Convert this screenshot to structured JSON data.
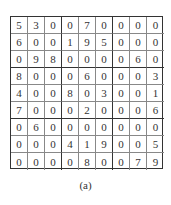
{
  "puzzle": {
    "grid": [
      [
        5,
        3,
        0,
        0,
        7,
        0,
        0,
        0,
        0
      ],
      [
        6,
        0,
        0,
        1,
        9,
        5,
        0,
        0,
        0
      ],
      [
        0,
        9,
        8,
        0,
        0,
        0,
        0,
        6,
        0
      ],
      [
        8,
        0,
        0,
        0,
        6,
        0,
        0,
        0,
        3
      ],
      [
        4,
        0,
        0,
        8,
        0,
        3,
        0,
        0,
        1
      ],
      [
        7,
        0,
        0,
        0,
        2,
        0,
        0,
        0,
        6
      ],
      [
        0,
        6,
        0,
        0,
        0,
        0,
        0,
        0,
        0
      ],
      [
        0,
        0,
        0,
        4,
        1,
        9,
        0,
        0,
        5
      ],
      [
        0,
        0,
        0,
        0,
        8,
        0,
        0,
        7,
        9
      ]
    ],
    "caption": "(a)"
  }
}
